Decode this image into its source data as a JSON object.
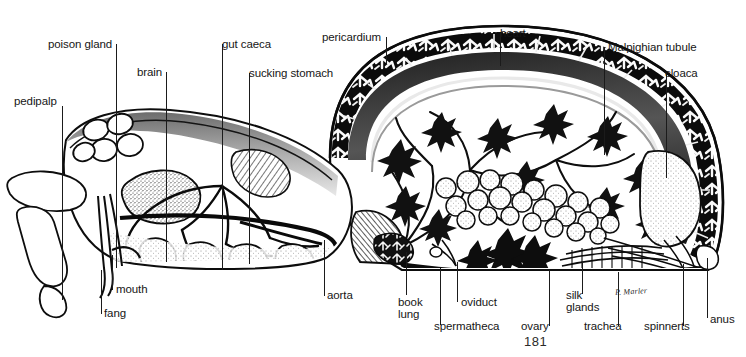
{
  "figure": {
    "page_number": "181",
    "artist_signature": "P. Marler",
    "ink_color": "#111111",
    "paper_color": "#ffffff",
    "labels": [
      {
        "id": "pedipalp",
        "text": "pedipalp",
        "x": 14,
        "y": 95,
        "leader": [
          [
            62,
            106
          ],
          [
            62,
            300
          ]
        ]
      },
      {
        "id": "poison-gland",
        "text": "poison gland",
        "x": 48,
        "y": 38,
        "leader": [
          [
            116,
            44
          ],
          [
            116,
            268
          ]
        ]
      },
      {
        "id": "brain",
        "text": "brain",
        "x": 137,
        "y": 66,
        "leader": [
          [
            166,
            72
          ],
          [
            166,
            262
          ]
        ]
      },
      {
        "id": "gut-caeca",
        "text": "gut caeca",
        "x": 222,
        "y": 38,
        "leader": [
          [
            222,
            44
          ],
          [
            222,
            270
          ]
        ]
      },
      {
        "id": "sucking-stomach",
        "text": "sucking stomach",
        "x": 249,
        "y": 67,
        "leader": [
          [
            249,
            73
          ],
          [
            249,
            264
          ]
        ]
      },
      {
        "id": "pericardium",
        "text": "pericardium",
        "x": 322,
        "y": 31,
        "leader": [
          [
            386,
            37
          ],
          [
            386,
            64
          ]
        ]
      },
      {
        "id": "heart",
        "text": "heart",
        "x": 500,
        "y": 27,
        "leader": [
          [
            500,
            33
          ],
          [
            500,
            66
          ]
        ]
      },
      {
        "id": "malpighian-tubule",
        "text": "Malpighian tubule",
        "x": 608,
        "y": 41,
        "leader": [
          [
            604,
            47
          ],
          [
            604,
            155
          ]
        ]
      },
      {
        "id": "cloaca",
        "text": "cloaca",
        "x": 665,
        "y": 67,
        "leader": [
          [
            666,
            74
          ],
          [
            666,
            178
          ]
        ]
      },
      {
        "id": "mouth",
        "text": "mouth",
        "x": 116,
        "y": 283,
        "leader": [
          [
            112,
            255
          ],
          [
            112,
            290
          ]
        ]
      },
      {
        "id": "fang",
        "text": "fang",
        "x": 104,
        "y": 307,
        "leader": [
          [
            101,
            270
          ],
          [
            101,
            314
          ]
        ]
      },
      {
        "id": "aorta",
        "text": "aorta",
        "x": 327,
        "y": 289,
        "leader": [
          [
            324,
            240
          ],
          [
            324,
            296
          ]
        ]
      },
      {
        "id": "book-lung",
        "text": "book\nlung",
        "x": 398,
        "y": 296,
        "leader": [
          [
            406,
            252
          ],
          [
            406,
            295
          ]
        ]
      },
      {
        "id": "oviduct",
        "text": "oviduct",
        "x": 461,
        "y": 296,
        "leader": [
          [
            457,
            262
          ],
          [
            457,
            302
          ]
        ]
      },
      {
        "id": "spermatheca",
        "text": "spermatheca",
        "x": 434,
        "y": 320,
        "leader": [
          [
            440,
            268
          ],
          [
            440,
            325
          ]
        ]
      },
      {
        "id": "ovary",
        "text": "ovary",
        "x": 521,
        "y": 320,
        "leader": [
          [
            549,
            270
          ],
          [
            549,
            326
          ]
        ]
      },
      {
        "id": "silk-glands",
        "text": "silk\nglands",
        "x": 566,
        "y": 289,
        "leader": [
          [
            582,
            262
          ],
          [
            582,
            294
          ]
        ]
      },
      {
        "id": "trachea",
        "text": "trachea",
        "x": 584,
        "y": 320,
        "leader": [
          [
            618,
            272
          ],
          [
            618,
            326
          ]
        ]
      },
      {
        "id": "spinnerts",
        "text": "spinnerts",
        "x": 644,
        "y": 320,
        "leader": [
          [
            683,
            264
          ],
          [
            683,
            326
          ]
        ]
      },
      {
        "id": "anus",
        "text": "anus",
        "x": 710,
        "y": 313,
        "leader": [
          [
            707,
            258
          ],
          [
            707,
            318
          ]
        ]
      }
    ],
    "parts": [
      "pedipalp",
      "poison gland",
      "brain",
      "gut caeca",
      "sucking stomach",
      "pericardium",
      "heart",
      "Malpighian tubule",
      "cloaca",
      "mouth",
      "fang",
      "aorta",
      "book lung",
      "oviduct",
      "spermatheca",
      "ovary",
      "silk glands",
      "trachea",
      "spinnerts",
      "anus"
    ]
  }
}
